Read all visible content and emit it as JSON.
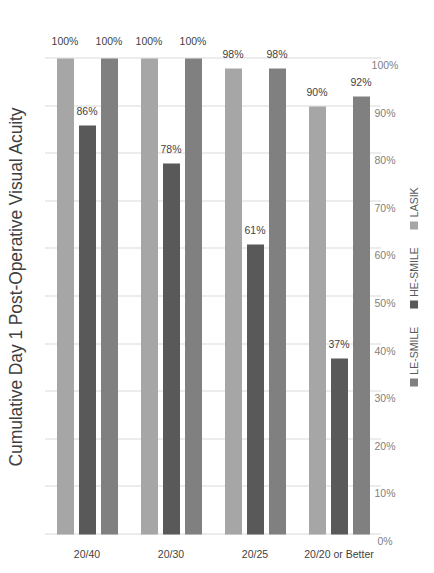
{
  "chart_data": {
    "type": "bar",
    "orientation": "horizontal",
    "title": "Cumulative Day 1 Post-Operative Visual Acuity",
    "xlabel": "",
    "ylabel": "",
    "xlim": [
      0,
      100
    ],
    "x_axis_reversed": true,
    "grid": true,
    "legend_position": "bottom",
    "tick_labels": [
      "100%",
      "90%",
      "80%",
      "70%",
      "60%",
      "50%",
      "40%",
      "30%",
      "20%",
      "10%",
      "0%"
    ],
    "tick_values": [
      100,
      90,
      80,
      70,
      60,
      50,
      40,
      30,
      20,
      10,
      0
    ],
    "categories": [
      "20/40",
      "20/30",
      "20/25",
      "20/20 or Better"
    ],
    "series": [
      {
        "name": "LASIK",
        "color": "#a6a6a6",
        "values": [
          100,
          100,
          98,
          90
        ],
        "labels": [
          "100%",
          "100%",
          "98%",
          "90%"
        ]
      },
      {
        "name": "HE-SMILE",
        "color": "#595959",
        "values": [
          86,
          78,
          61,
          37
        ],
        "labels": [
          "86%",
          "78%",
          "61%",
          "37%"
        ]
      },
      {
        "name": "LE-SMILE",
        "color": "#808080",
        "values": [
          100,
          100,
          98,
          92
        ],
        "labels": [
          "100%",
          "100%",
          "98%",
          "92%"
        ]
      }
    ],
    "legend": [
      {
        "label": "LE-SMILE",
        "color": "#808080"
      },
      {
        "label": "HE-SMILE",
        "color": "#595959"
      },
      {
        "label": "LASIK",
        "color": "#a6a6a6"
      }
    ]
  },
  "colors": {
    "gridline": "#d9d9d9",
    "text": "#3f3f3f",
    "tick_text": "#7f7f7f",
    "legend_text": "#595959",
    "background": "#ffffff"
  }
}
